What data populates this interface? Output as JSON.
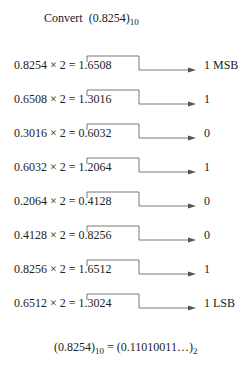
{
  "title": {
    "prefix": "Convert",
    "value": "(0.8254)",
    "base": "10"
  },
  "steps": [
    {
      "equation": "0.8254 × 2 = 1.6508",
      "bit": "1 MSB"
    },
    {
      "equation": "0.6508 × 2 = 1.3016",
      "bit": "1"
    },
    {
      "equation": "0.3016 × 2 = 0.6032",
      "bit": "0"
    },
    {
      "equation": "0.6032 × 2 = 1.2064",
      "bit": "1"
    },
    {
      "equation": "0.2064 × 2 = 0.4128",
      "bit": "0"
    },
    {
      "equation": "0.4128 × 2 = 0.8256",
      "bit": "0"
    },
    {
      "equation": "0.8256 × 2 = 1.6512",
      "bit": "1"
    },
    {
      "equation": "0.6512 × 2 = 1.3024",
      "bit": "1 LSB"
    }
  ],
  "result": {
    "lhs": "(0.8254)",
    "lhs_base": "10",
    "eq": " = ",
    "rhs": "(0.11010011…)",
    "rhs_base": "2"
  },
  "colors": {
    "line": "#555555",
    "text": "#222222"
  }
}
